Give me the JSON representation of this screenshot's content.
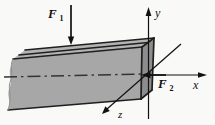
{
  "diagram": {
    "background_color": "#f9f9f8",
    "beam": {
      "front_color": "#a7a7a7",
      "top_color": "#b3b3b3",
      "section_color": "#8d8d8d",
      "edge_color": "#1f1f1f"
    },
    "axis_color": "#111111",
    "labels": {
      "force1": {
        "symbol": "F",
        "subscript": "1"
      },
      "force2": {
        "symbol": "F",
        "subscript": "2"
      },
      "axis_x": "x",
      "axis_y": "y",
      "axis_z": "z"
    }
  }
}
